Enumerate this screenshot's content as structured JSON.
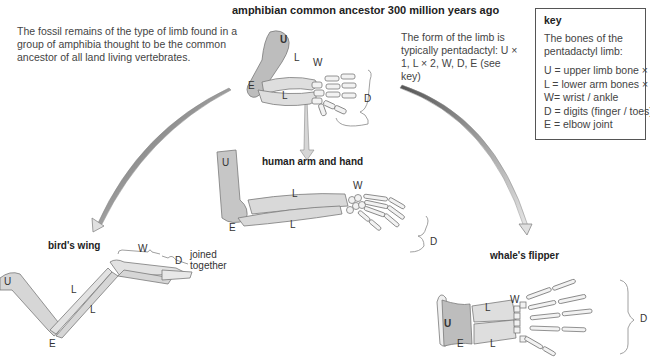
{
  "title": "amphibian common ancestor 300 million years ago",
  "intro_text": "The fossil remains of the type of limb found in a group of amphibia thought to be the common ancestor of all land living vertebrates.",
  "form_text": "The form of the limb is typically pentadactyl: U × 1, L × 2, W, D, E (see key)",
  "key": {
    "title": "key",
    "intro": "The bones of the pentadactyl limb:",
    "items": [
      "U = upper limb bone × 1",
      "L  = lower arm bones × 2",
      "W= wrist / ankle",
      "D = digits (finger / toes)",
      "E  = elbow joint"
    ]
  },
  "limbs": {
    "ancestor": {
      "labels": {
        "U": "U",
        "L1": "L",
        "L2": "L",
        "W": "W",
        "D": "D",
        "E": "E"
      }
    },
    "human": {
      "title": "human arm and hand",
      "labels": {
        "U": "U",
        "L1": "L",
        "L2": "L",
        "W": "W",
        "D": "D",
        "E": "E"
      }
    },
    "bird": {
      "title": "bird's wing",
      "labels": {
        "U": "U",
        "L1": "L",
        "L2": "L",
        "W": "W",
        "D": "D",
        "E": "E"
      },
      "note": "joined together"
    },
    "whale": {
      "title": "whale's flipper",
      "labels": {
        "U": "U",
        "L1": "L",
        "L2": "L",
        "W": "W",
        "D": "D",
        "E": "E"
      }
    }
  },
  "colors": {
    "bone_fill": "#d9d9d9",
    "upper_bone_fill": "#bdbdbd",
    "bone_stroke": "#7a7a7a",
    "arrow_fill": "#d0d0d0",
    "arrow_stroke": "#666666"
  }
}
